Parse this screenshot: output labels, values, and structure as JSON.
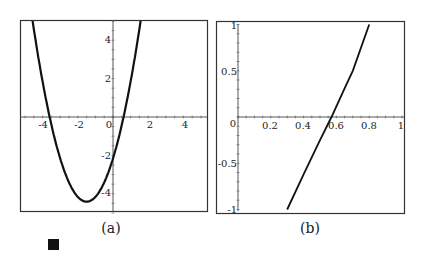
{
  "chart_data": [
    {
      "type": "line",
      "panel": "a",
      "caption": "(a)",
      "title": "",
      "xlabel": "",
      "ylabel": "",
      "xlim": [
        -5.2,
        5.3
      ],
      "ylim": [
        -5.0,
        5.1
      ],
      "xticks": [
        -4,
        -2,
        0,
        2,
        4
      ],
      "xtick_labels": [
        "-4",
        "-2",
        "0",
        "2",
        "4"
      ],
      "yticks": [
        4,
        2,
        -2,
        -4
      ],
      "ytick_labels": [
        "4",
        "2",
        "-2",
        "-4"
      ],
      "grid": false,
      "legend": null,
      "series": [
        {
          "name": "parabola",
          "description": "upward parabola, roots near x=-3.6 and x=0.6, minimum near (-1.5, -4.4)",
          "x": [
            -4.75,
            -4.5,
            -4,
            -3.6,
            -3,
            -2.5,
            -2,
            -1.5,
            -1,
            -0.5,
            0,
            0.6,
            1,
            1.5
          ],
          "y": [
            6.1,
            4.6,
            1.8,
            0.0,
            -2.2,
            -3.4,
            -4.2,
            -4.4,
            -4.2,
            -3.4,
            -2.2,
            0.0,
            1.8,
            4.6
          ]
        }
      ]
    },
    {
      "type": "line",
      "panel": "b",
      "caption": "(b)",
      "title": "",
      "xlabel": "",
      "ylabel": "",
      "xlim": [
        -0.13,
        1.0
      ],
      "ylim": [
        -1.05,
        1.0
      ],
      "xticks": [
        0,
        0.2,
        0.4,
        0.6,
        0.8,
        1
      ],
      "xtick_labels": [
        "0",
        "0.2",
        "0.4",
        "0.6",
        "0.8",
        "1"
      ],
      "yticks": [
        1,
        0.5,
        -0.5,
        -1
      ],
      "ytick_labels": [
        "1",
        "0.5",
        "-0.5",
        "-1"
      ],
      "grid": false,
      "legend": null,
      "series": [
        {
          "name": "curve",
          "description": "nearly linear increasing curve crossing zero near x=0.57",
          "x": [
            0.3,
            0.4,
            0.5,
            0.57,
            0.65,
            0.7,
            0.8
          ],
          "y": [
            -1.0,
            -0.62,
            -0.25,
            0.0,
            0.31,
            0.5,
            1.0
          ]
        }
      ]
    }
  ],
  "decorations": {
    "end_of_proof_symbol": "■"
  }
}
